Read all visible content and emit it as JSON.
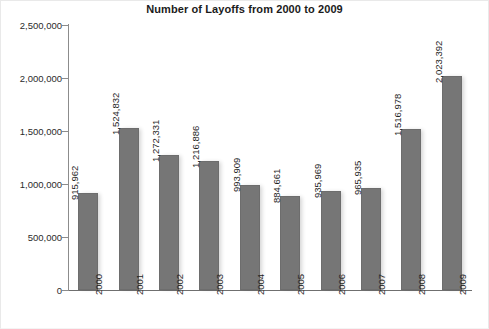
{
  "chart_data": {
    "type": "bar",
    "title": "Number of Layoffs from 2000 to 2009",
    "xlabel": "",
    "ylabel": "",
    "categories": [
      "2000",
      "2001",
      "2002",
      "2003",
      "2004",
      "2005",
      "2006",
      "2007",
      "2008",
      "2009"
    ],
    "values": [
      915962,
      1524832,
      1272331,
      1216886,
      993909,
      884661,
      935969,
      965935,
      1516978,
      2023392
    ],
    "value_labels": [
      "915,962",
      "1,524,832",
      "1,272,331",
      "1,216,886",
      "993,909",
      "884,661",
      "935,969",
      "965,935",
      "1,516,978",
      "2,023,392"
    ],
    "ylim": [
      0,
      2500000
    ],
    "y_ticks": [
      0,
      500000,
      1000000,
      1500000,
      2000000,
      2500000
    ],
    "y_tick_labels": [
      "0",
      "500,000",
      "1,000,000",
      "1,500,000",
      "2,000,000",
      "2,500,000"
    ],
    "grid": false,
    "legend": null,
    "bar_color": "#767676",
    "text_color": "#1f1f1f",
    "axis_color": "#8c8c8c",
    "background_color": "#ffffff"
  }
}
